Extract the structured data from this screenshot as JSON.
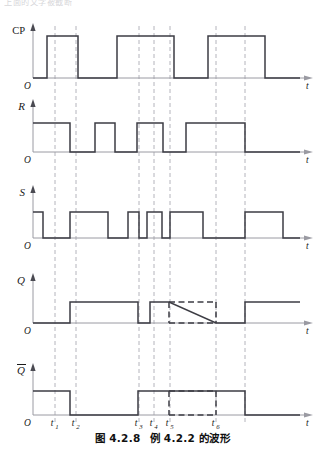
{
  "figure": {
    "top_cut_text": "上面的文字被截断",
    "caption_prefix": "图 4.2.8",
    "caption_body": "例 4.2.2 的波形",
    "background_color": "#ffffff",
    "waveform_color": "#3d3d44",
    "axis_color": "#9a9aa2",
    "dashed_guide_color": "#b4b4bc",
    "uncertain_color": "#3d3d44"
  },
  "axes": {
    "time_axis_label": "t",
    "origin_label": "O",
    "x_origin": 33,
    "x_end": 305,
    "tick_labels": [
      "t",
      "t",
      "t",
      "t",
      "t",
      "t"
    ],
    "tick_subscripts": [
      "1",
      "2",
      "3",
      "4",
      "5",
      "6"
    ],
    "tick_positions": [
      55,
      76,
      139,
      154,
      170,
      216
    ]
  },
  "signals": [
    {
      "name": "CP",
      "label": "CP",
      "italic": false,
      "baseline_y": 78,
      "high_y": 36,
      "axis_top_y": 26,
      "segments": [
        {
          "x0": 33,
          "x1": 47,
          "level": 0,
          "style": "solid"
        },
        {
          "x0": 47,
          "x1": 78,
          "level": 1,
          "style": "solid"
        },
        {
          "x0": 78,
          "x1": 117,
          "level": 0,
          "style": "solid"
        },
        {
          "x0": 117,
          "x1": 174,
          "level": 1,
          "style": "solid"
        },
        {
          "x0": 174,
          "x1": 208,
          "level": 0,
          "style": "solid"
        },
        {
          "x0": 208,
          "x1": 265,
          "level": 1,
          "style": "solid"
        },
        {
          "x0": 265,
          "x1": 300,
          "level": 0,
          "style": "solid"
        }
      ]
    },
    {
      "name": "R",
      "label": "R",
      "italic": true,
      "baseline_y": 152,
      "high_y": 123,
      "axis_top_y": 102,
      "segments": [
        {
          "x0": 33,
          "x1": 70,
          "level": 1,
          "style": "solid"
        },
        {
          "x0": 70,
          "x1": 95,
          "level": 0,
          "style": "solid"
        },
        {
          "x0": 95,
          "x1": 115,
          "level": 1,
          "style": "solid"
        },
        {
          "x0": 115,
          "x1": 137,
          "level": 0,
          "style": "solid"
        },
        {
          "x0": 137,
          "x1": 163,
          "level": 1,
          "style": "solid"
        },
        {
          "x0": 163,
          "x1": 186,
          "level": 0,
          "style": "solid"
        },
        {
          "x0": 186,
          "x1": 245,
          "level": 1,
          "style": "solid"
        },
        {
          "x0": 245,
          "x1": 300,
          "level": 0,
          "style": "solid"
        }
      ]
    },
    {
      "name": "S",
      "label": "S",
      "italic": true,
      "baseline_y": 238,
      "high_y": 212,
      "axis_top_y": 188,
      "segments": [
        {
          "x0": 33,
          "x1": 43,
          "level": 1,
          "style": "solid"
        },
        {
          "x0": 43,
          "x1": 70,
          "level": 0,
          "style": "solid"
        },
        {
          "x0": 70,
          "x1": 108,
          "level": 1,
          "style": "solid"
        },
        {
          "x0": 108,
          "x1": 128,
          "level": 0,
          "style": "solid"
        },
        {
          "x0": 128,
          "x1": 139,
          "level": 1,
          "style": "solid"
        },
        {
          "x0": 139,
          "x1": 147,
          "level": 0,
          "style": "solid"
        },
        {
          "x0": 147,
          "x1": 162,
          "level": 1,
          "style": "solid"
        },
        {
          "x0": 162,
          "x1": 170,
          "level": 0,
          "style": "solid"
        },
        {
          "x0": 170,
          "x1": 203,
          "level": 1,
          "style": "solid"
        },
        {
          "x0": 203,
          "x1": 245,
          "level": 0,
          "style": "solid"
        },
        {
          "x0": 245,
          "x1": 283,
          "level": 1,
          "style": "solid"
        },
        {
          "x0": 283,
          "x1": 300,
          "level": 0,
          "style": "solid"
        }
      ]
    },
    {
      "name": "Q",
      "label": "Q",
      "italic": true,
      "baseline_y": 323,
      "high_y": 302,
      "axis_top_y": 276,
      "segments": [
        {
          "x0": 33,
          "x1": 70,
          "level": 0,
          "style": "solid"
        },
        {
          "x0": 70,
          "x1": 138,
          "level": 1,
          "style": "solid"
        },
        {
          "x0": 138,
          "x1": 150,
          "level": 0,
          "style": "solid"
        },
        {
          "x0": 150,
          "x1": 169,
          "level": 1,
          "style": "solid"
        },
        {
          "x0": 169,
          "x1": 216,
          "level": 1,
          "style": "dashed"
        },
        {
          "x0": 169,
          "x1": 216,
          "level": 0,
          "style": "dashed"
        },
        {
          "x0": 216,
          "x1": 245,
          "level": 0,
          "style": "solid"
        },
        {
          "x0": 245,
          "x1": 300,
          "level": 1,
          "style": "solid"
        }
      ]
    },
    {
      "name": "Qbar",
      "label": "Q",
      "overline": true,
      "italic": true,
      "baseline_y": 415,
      "high_y": 391,
      "axis_top_y": 366,
      "segments": [
        {
          "x0": 33,
          "x1": 70,
          "level": 1,
          "style": "solid"
        },
        {
          "x0": 70,
          "x1": 138,
          "level": 0,
          "style": "solid"
        },
        {
          "x0": 138,
          "x1": 169,
          "level": 1,
          "style": "solid"
        },
        {
          "x0": 169,
          "x1": 216,
          "level": 1,
          "style": "dashed"
        },
        {
          "x0": 169,
          "x1": 216,
          "level": 0,
          "style": "dashed"
        },
        {
          "x0": 216,
          "x1": 245,
          "level": 1,
          "style": "solid"
        },
        {
          "x0": 245,
          "x1": 300,
          "level": 0,
          "style": "solid"
        }
      ]
    }
  ],
  "guides": {
    "lines": [
      {
        "x": 55,
        "y0": 26,
        "y1": 425
      },
      {
        "x": 76,
        "y0": 26,
        "y1": 425
      },
      {
        "x": 139,
        "y0": 26,
        "y1": 425
      },
      {
        "x": 154,
        "y0": 26,
        "y1": 425
      },
      {
        "x": 170,
        "y0": 26,
        "y1": 425
      },
      {
        "x": 216,
        "y0": 26,
        "y1": 425
      },
      {
        "x": 245,
        "y0": 26,
        "y1": 425
      }
    ]
  }
}
